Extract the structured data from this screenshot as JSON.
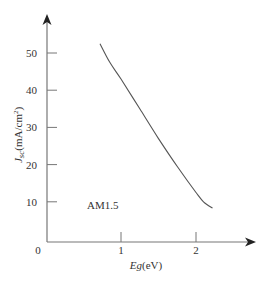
{
  "chart_data": {
    "type": "line",
    "title": "",
    "xlabel": "Eg(eV)",
    "xlabel_parts": {
      "main": "Eg",
      "unit": "(eV)"
    },
    "ylabel": "Jsc(mA/cm²)",
    "ylabel_parts": {
      "main": "J",
      "sub": "sc",
      "unit": "(mA/cm",
      "sup": "2",
      "close": ")"
    },
    "xlim": [
      0,
      2.8
    ],
    "ylim": [
      0,
      58
    ],
    "x_ticks": [
      1,
      2
    ],
    "x_tick_labels": [
      "1",
      "2"
    ],
    "y_ticks": [
      10,
      20,
      30,
      40,
      50
    ],
    "y_tick_labels": [
      "10",
      "20",
      "30",
      "40",
      "50"
    ],
    "origin_label": "0",
    "grid": false,
    "legend": null,
    "annotations": [
      {
        "text": "AM1.5",
        "x": 0.55,
        "y": 9
      }
    ],
    "series": [
      {
        "name": "Jsc vs Eg (AM1.5)",
        "x": [
          0.72,
          0.85,
          1.0,
          1.25,
          1.5,
          1.75,
          2.0,
          2.1,
          2.22
        ],
        "y": [
          52.5,
          47.5,
          43.0,
          35.0,
          27.0,
          19.5,
          12.5,
          10.0,
          8.3
        ]
      }
    ],
    "colors": {
      "line": "#555555",
      "axis": "#777777",
      "text": "#333333"
    }
  }
}
